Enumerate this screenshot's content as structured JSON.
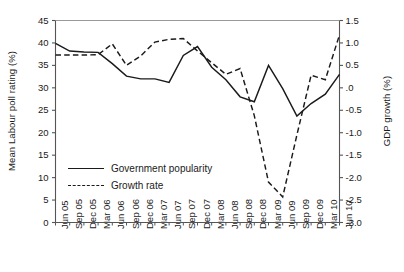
{
  "chart_data": {
    "type": "line",
    "title": "",
    "xlabel": "",
    "ylabel": "Mean Labour poll rating (%)",
    "y2label": "GDP growth (%)",
    "grid": false,
    "legend_position": "inside-left",
    "categories": [
      "Jun 05",
      "Sep 05",
      "Dec 05",
      "Mar 06",
      "Jun 06",
      "Sep 06",
      "Dec 06",
      "Mar 07",
      "Jun 07",
      "Sep 07",
      "Dec 07",
      "Mar 08",
      "Jun 08",
      "Sep 08",
      "Dec 08",
      "Mar 09",
      "Jun 09",
      "Sep 09",
      "Dec 09",
      "Mar 10",
      "Jun 10"
    ],
    "ylim": [
      0,
      45
    ],
    "yticks": [
      "0",
      "5",
      "10",
      "15",
      "20",
      "25",
      "30",
      "35",
      "40",
      "45"
    ],
    "y2lim": [
      -3.0,
      1.5
    ],
    "y2ticks": [
      "-3.0",
      "-2.5",
      "-2.0",
      "-1.5",
      "-1.0",
      "-0.5",
      ".0",
      "0.5",
      "1.0",
      "1.5"
    ],
    "series": [
      {
        "name": "Government popularity",
        "axis": "left",
        "style": "solid",
        "color": "#1a1a1a",
        "values": [
          39.9,
          38.2,
          38.0,
          37.9,
          35.4,
          32.6,
          32.0,
          32.0,
          31.2,
          37.2,
          39.2,
          34.6,
          31.8,
          28.0,
          26.9,
          35.0,
          29.8,
          23.7,
          26.5,
          28.6,
          33.0
        ]
      },
      {
        "name": "Growth rate",
        "axis": "right",
        "style": "dashed",
        "color": "#1a1a1a",
        "values": [
          0.73,
          0.73,
          0.73,
          0.74,
          0.98,
          0.5,
          0.71,
          1.02,
          1.08,
          1.1,
          0.82,
          0.56,
          0.3,
          0.43,
          -0.62,
          -2.1,
          -2.43,
          -1.05,
          0.28,
          0.18,
          1.18
        ]
      }
    ],
    "legend": [
      {
        "label": "Government popularity",
        "style": "solid"
      },
      {
        "label": "Growth rate",
        "style": "dashed"
      }
    ]
  }
}
